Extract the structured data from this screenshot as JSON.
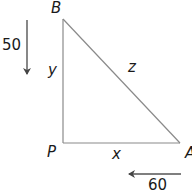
{
  "diagram": {
    "type": "right-triangle-related-rates",
    "vertices": {
      "B": {
        "label": "B"
      },
      "P": {
        "label": "P"
      },
      "A": {
        "label": "A"
      }
    },
    "sides": {
      "vertical": {
        "label": "y"
      },
      "horizontal": {
        "label": "x"
      },
      "hypotenuse": {
        "label": "z"
      }
    },
    "arrows": {
      "down": {
        "label": "50",
        "direction": "down"
      },
      "left": {
        "label": "60",
        "direction": "left"
      }
    },
    "colors": {
      "line": "#8a8a8a",
      "arrow": "#555555",
      "text": "#1a1a1a",
      "background": "#ffffff"
    }
  }
}
